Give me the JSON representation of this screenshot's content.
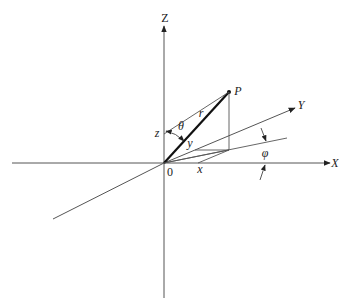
{
  "diagram": {
    "type": "spherical-coordinates",
    "axes": {
      "z_label": "Z",
      "x_label": "X",
      "y_label": "Y"
    },
    "point_label": "P",
    "origin_label": "0",
    "radius_label": "r",
    "theta_label": "θ",
    "phi_label": "φ",
    "x_coord_label": "x",
    "y_coord_label": "y",
    "z_coord_label": "z",
    "colors": {
      "line": "#444444",
      "thick_line": "#111111",
      "text": "#222222",
      "background": "#ffffff"
    }
  }
}
